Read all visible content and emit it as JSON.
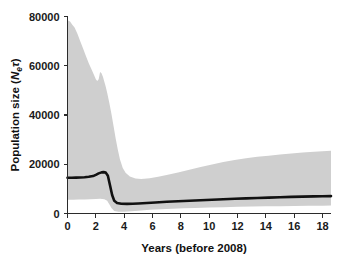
{
  "figure": {
    "background_color": "#ffffff",
    "band_color": "#cfcfcf",
    "line_color": "#111111",
    "axis_color": "#2b2b2b"
  },
  "axes": {
    "y_title_main": "Population size (",
    "y_title_italic_n": "N",
    "y_title_sub_e": "e",
    "y_title_tau": "τ",
    "y_title_close": ")",
    "x_title": "Years (before 2008)",
    "y_ticks": [
      "0",
      "20000",
      "40000",
      "60000",
      "80000"
    ],
    "x_ticks": [
      "0",
      "2",
      "4",
      "6",
      "8",
      "10",
      "12",
      "14",
      "16",
      "18"
    ],
    "y_min": 0,
    "y_max": 80000,
    "x_min": 0,
    "x_max": 18.6
  },
  "chart_data": {
    "type": "line",
    "title": "",
    "subtitle": "",
    "xlabel": "Years (before 2008)",
    "ylabel": "Population size (Net)",
    "xlim": [
      0,
      18.6
    ],
    "ylim": [
      0,
      80000
    ],
    "grid": false,
    "legend": "none",
    "x_tick_values": [
      0,
      2,
      4,
      6,
      8,
      10,
      12,
      14,
      16,
      18
    ],
    "y_tick_values": [
      0,
      20000,
      40000,
      60000,
      80000
    ],
    "annotations": [],
    "series": [
      {
        "name": "Median population size",
        "style": "solid-black-thick",
        "x": [
          0.0,
          0.3,
          0.6,
          0.9,
          1.2,
          1.5,
          1.8,
          2.0,
          2.2,
          2.4,
          2.55,
          2.7,
          2.85,
          3.0,
          3.15,
          3.3,
          3.5,
          3.8,
          4.2,
          4.6,
          5.0,
          5.6,
          6.2,
          7.0,
          7.8,
          8.6,
          9.4,
          10.2,
          11.0,
          11.8,
          12.6,
          13.4,
          14.2,
          15.0,
          15.8,
          16.6,
          17.4,
          18.0,
          18.6
        ],
        "y": [
          14500,
          14500,
          14550,
          14600,
          14700,
          14900,
          15200,
          15700,
          16300,
          16700,
          16800,
          16600,
          15300,
          11500,
          7500,
          5200,
          4300,
          3950,
          3900,
          3950,
          4050,
          4250,
          4450,
          4750,
          5000,
          5200,
          5400,
          5600,
          5800,
          6000,
          6150,
          6300,
          6450,
          6600,
          6750,
          6850,
          6950,
          7000,
          7050
        ]
      },
      {
        "name": "Upper 95% HPD",
        "style": "band-upper",
        "x": [
          0.0,
          0.18,
          0.35,
          0.5,
          0.7,
          0.9,
          1.1,
          1.3,
          1.5,
          1.7,
          1.85,
          2.0,
          2.1,
          2.2,
          2.3,
          2.4,
          2.5,
          2.6,
          2.7,
          2.8,
          2.95,
          3.1,
          3.25,
          3.4,
          3.55,
          3.7,
          3.9,
          4.1,
          4.4,
          4.8,
          5.2,
          5.8,
          6.4,
          7.0,
          7.8,
          8.6,
          9.4,
          10.2,
          11.0,
          11.8,
          12.6,
          13.4,
          14.2,
          15.0,
          15.8,
          16.6,
          17.4,
          18.0,
          18.6
        ],
        "y": [
          78500,
          78000,
          76500,
          75500,
          73000,
          70000,
          67000,
          64000,
          61000,
          58500,
          56500,
          54500,
          53800,
          54500,
          57500,
          57000,
          55500,
          53500,
          51500,
          49000,
          45000,
          40500,
          35500,
          30500,
          26000,
          22000,
          18500,
          16500,
          15000,
          14200,
          14000,
          14300,
          14900,
          15600,
          16700,
          17800,
          18900,
          19900,
          20900,
          21700,
          22400,
          23000,
          23500,
          24000,
          24400,
          24800,
          25100,
          25300,
          25500
        ]
      },
      {
        "name": "Lower 95% HPD",
        "style": "band-lower",
        "x": [
          0.0,
          0.4,
          0.8,
          1.2,
          1.6,
          2.0,
          2.3,
          2.6,
          2.8,
          2.95,
          3.1,
          3.3,
          3.6,
          4.0,
          4.5,
          5.0,
          5.8,
          6.6,
          7.4,
          8.2,
          9.0,
          10.0,
          11.0,
          12.0,
          13.0,
          14.0,
          15.0,
          16.0,
          17.0,
          18.0,
          18.6
        ],
        "y": [
          5600,
          5600,
          5650,
          5700,
          5800,
          5900,
          5950,
          5800,
          5200,
          3800,
          2200,
          1000,
          700,
          700,
          900,
          1150,
          1500,
          1750,
          1950,
          2100,
          2250,
          2400,
          2550,
          2700,
          2800,
          2900,
          2980,
          3050,
          3120,
          3180,
          3220
        ]
      }
    ]
  }
}
